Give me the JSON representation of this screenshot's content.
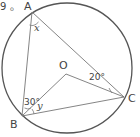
{
  "prefix_text": "9 。",
  "circle": {
    "cx": 67,
    "cy": 68,
    "r": 65,
    "stroke": "#555555"
  },
  "points": {
    "A": {
      "x": 32,
      "y": 12,
      "label": "A",
      "lx": 24,
      "ly": 10
    },
    "B": {
      "x": 22,
      "y": 116,
      "label": "B",
      "lx": 10,
      "ly": 128
    },
    "C": {
      "x": 124,
      "y": 97,
      "label": "C",
      "lx": 128,
      "ly": 102
    },
    "O": {
      "x": 66,
      "y": 74,
      "label": "O",
      "lx": 59,
      "ly": 69
    }
  },
  "segments": [
    [
      "A",
      "B"
    ],
    [
      "A",
      "C"
    ],
    [
      "B",
      "O"
    ],
    [
      "O",
      "C"
    ],
    [
      "B",
      "C"
    ]
  ],
  "angle_labels": {
    "x": {
      "text": "x",
      "x": 34,
      "y": 31
    },
    "angle_OCA": {
      "text": "20°",
      "x": 89,
      "y": 80
    },
    "angle_ABO": {
      "text": "30°",
      "x": 24,
      "y": 105
    },
    "y": {
      "text": "y",
      "x": 37,
      "y": 109
    }
  },
  "line_color": "#777777"
}
